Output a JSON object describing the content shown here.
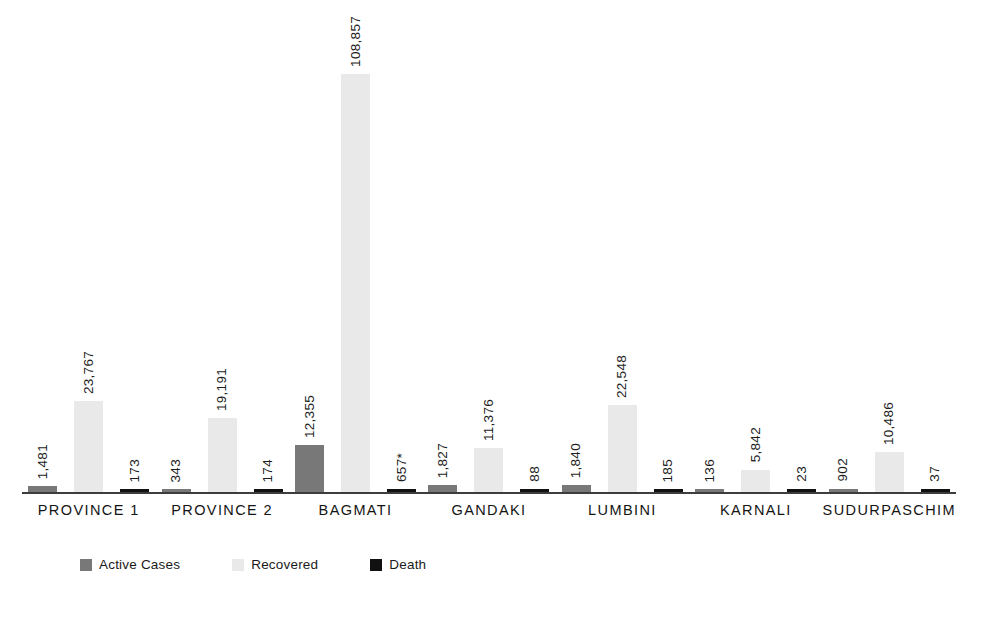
{
  "chart_data": {
    "type": "bar",
    "title": "",
    "xlabel": "",
    "ylabel": "",
    "grid": false,
    "legend_position": "bottom-left",
    "ylim": [
      0,
      123000
    ],
    "categories": [
      "PROVINCE 1",
      "PROVINCE 2",
      "BAGMATI",
      "GANDAKI",
      "LUMBINI",
      "KARNALI",
      "SUDURPASCHIM"
    ],
    "series": [
      {
        "name": "Active Cases",
        "color": "#787878",
        "values": [
          1481,
          343,
          12355,
          1827,
          1840,
          136,
          902
        ],
        "labels": [
          "1,481",
          "343",
          "12,355",
          "1,827",
          "1,840",
          "136",
          "902"
        ]
      },
      {
        "name": "Recovered",
        "color": "#e9e9e9",
        "values": [
          23767,
          19191,
          108857,
          11376,
          22548,
          5842,
          10486
        ],
        "labels": [
          "23,767",
          "19,191",
          "108,857",
          "11,376",
          "22,548",
          "5,842",
          "10,486"
        ]
      },
      {
        "name": "Death",
        "color": "#111111",
        "values": [
          173,
          174,
          657,
          88,
          185,
          23,
          37
        ],
        "labels": [
          "173",
          "174",
          "657*",
          "88",
          "185",
          "23",
          "37"
        ]
      }
    ]
  },
  "legend": {
    "items": [
      {
        "label": "Active Cases",
        "color": "#787878"
      },
      {
        "label": "Recovered",
        "color": "#e9e9e9"
      },
      {
        "label": "Death",
        "color": "#111111"
      }
    ]
  },
  "axis": {
    "baseline_color": "#3d3d3d"
  }
}
